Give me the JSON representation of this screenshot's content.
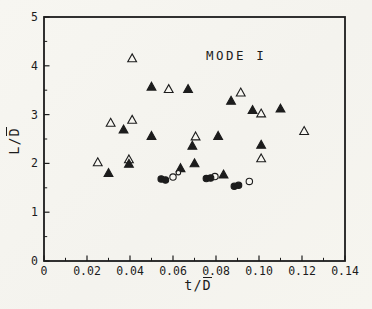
{
  "figure": {
    "ink_color": "#1c1c1c",
    "paper_color": "#f6f5f0"
  },
  "chart_data": {
    "type": "scatter",
    "title": "",
    "annotation": {
      "text": "MODE I",
      "x": 0.086,
      "y": 4.2
    },
    "xlabel": "t/D̄",
    "ylabel": "L/D̄",
    "xlabel_parts": {
      "pre": "t/",
      "bar": "D"
    },
    "ylabel_parts": {
      "pre": "L/",
      "bar": "D"
    },
    "xlim": [
      0,
      0.14
    ],
    "ylim": [
      0,
      5
    ],
    "x_ticks": [
      0,
      0.02,
      0.04,
      0.06,
      0.08,
      0.1,
      0.12,
      0.14
    ],
    "x_tick_labels": [
      "0",
      "0.02",
      "0.04",
      "0.06",
      "0.08",
      "0.10",
      "0.12",
      "0.14"
    ],
    "y_ticks": [
      0,
      1,
      2,
      3,
      4,
      5
    ],
    "y_tick_labels": [
      "0",
      "1",
      "2",
      "3",
      "4",
      "5"
    ],
    "x_minor_step": 0.01,
    "y_minor_step": 0.5,
    "grid": false,
    "legend_position": "none",
    "series": [
      {
        "name": "open triangle",
        "marker": "triangle-open",
        "points": [
          [
            0.025,
            2.02
          ],
          [
            0.031,
            2.83
          ],
          [
            0.0395,
            2.08
          ],
          [
            0.041,
            2.89
          ],
          [
            0.041,
            4.15
          ],
          [
            0.058,
            3.52
          ],
          [
            0.0705,
            2.55
          ],
          [
            0.0915,
            3.45
          ],
          [
            0.101,
            3.02
          ],
          [
            0.101,
            2.1
          ],
          [
            0.121,
            2.66
          ]
        ]
      },
      {
        "name": "filled triangle",
        "marker": "triangle-filled",
        "points": [
          [
            0.03,
            1.8
          ],
          [
            0.037,
            2.69
          ],
          [
            0.0395,
            1.99
          ],
          [
            0.05,
            3.57
          ],
          [
            0.05,
            2.56
          ],
          [
            0.0635,
            1.9
          ],
          [
            0.067,
            3.52
          ],
          [
            0.069,
            2.36
          ],
          [
            0.07,
            2.0
          ],
          [
            0.081,
            2.56
          ],
          [
            0.0835,
            1.77
          ],
          [
            0.087,
            3.28
          ],
          [
            0.097,
            3.09
          ],
          [
            0.101,
            2.38
          ],
          [
            0.11,
            3.12
          ]
        ]
      },
      {
        "name": "open circle",
        "marker": "circle-open",
        "points": [
          [
            0.06,
            1.72
          ],
          [
            0.0625,
            1.81,
            0.7
          ],
          [
            0.0795,
            1.73
          ],
          [
            0.0955,
            1.63
          ]
        ]
      },
      {
        "name": "filled circle",
        "marker": "circle-filled",
        "points": [
          [
            0.0545,
            1.68
          ],
          [
            0.0565,
            1.66
          ],
          [
            0.0755,
            1.69
          ],
          [
            0.0775,
            1.7
          ],
          [
            0.0885,
            1.53
          ],
          [
            0.0905,
            1.55
          ]
        ]
      }
    ]
  }
}
